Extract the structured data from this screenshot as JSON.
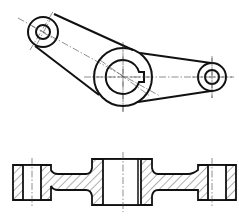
{
  "drawing": {
    "title": "Lever part - two-view engineering drawing",
    "views": [
      {
        "id": "top-view",
        "label": "Plan view (top)"
      },
      {
        "id": "section-view",
        "label": "Sectional front view (bottom)"
      }
    ],
    "features": {
      "left_boss": {
        "center": [
          43,
          32
        ],
        "outer_r": 15,
        "bore_r": 7
      },
      "center_hub": {
        "center": [
          123,
          77
        ],
        "outer_r": 29,
        "bore_r": 17,
        "keyway": "right"
      },
      "right_boss": {
        "center": [
          212,
          77
        ],
        "outer_r": 14,
        "bore_r": 7
      }
    },
    "colors": {
      "line": "#111111",
      "background": "#ffffff"
    }
  }
}
